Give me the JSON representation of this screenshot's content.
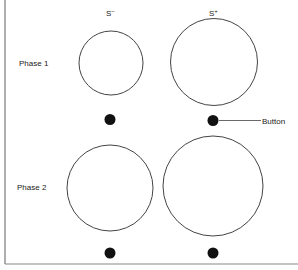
{
  "columns": [
    {
      "label": "S",
      "sup": "−"
    },
    {
      "label": "S",
      "sup": "+"
    }
  ],
  "rows": [
    {
      "label": "Phase 1"
    },
    {
      "label": "Phase 2"
    }
  ],
  "annotation": {
    "label": "Button"
  }
}
